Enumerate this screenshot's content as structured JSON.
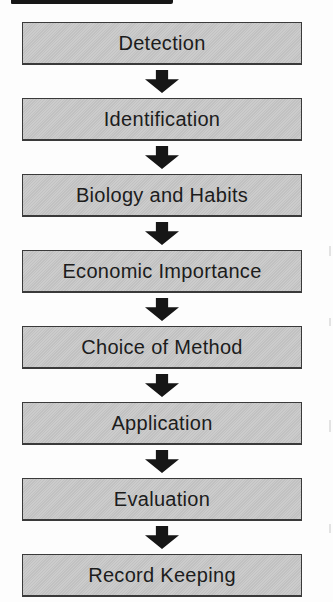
{
  "flowchart": {
    "type": "vertical-flow",
    "connector": "down-arrow",
    "steps": [
      {
        "label": "Detection"
      },
      {
        "label": "Identification"
      },
      {
        "label": "Biology and Habits"
      },
      {
        "label": "Economic Importance"
      },
      {
        "label": "Choice of Method"
      },
      {
        "label": "Application"
      },
      {
        "label": "Evaluation"
      },
      {
        "label": "Record Keeping"
      }
    ]
  },
  "colors": {
    "box_fill": "#c9c9c9",
    "box_border": "#3a3a3a",
    "arrow": "#161616",
    "text": "#1c1c1c",
    "page_background": "#fdfdfd",
    "top_bar": "#161616"
  }
}
